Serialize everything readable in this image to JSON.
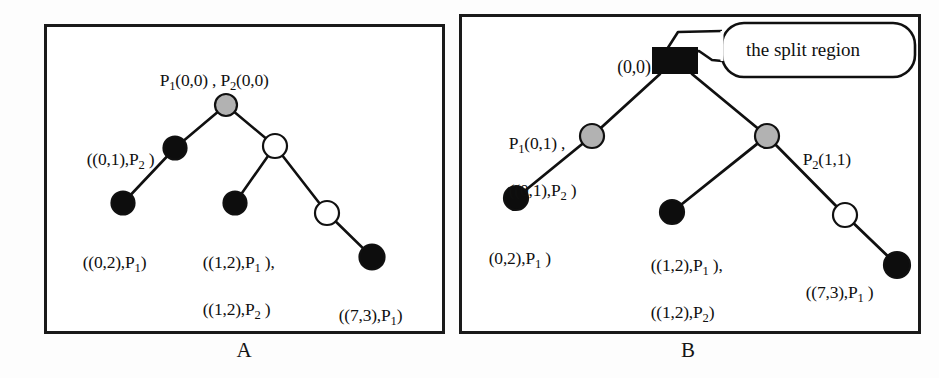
{
  "figure": {
    "panels": [
      {
        "id": "A",
        "caption": "A",
        "labels": {
          "root": "P1(0,0) , P2(0,0)",
          "left_child": "((0,1),P2 )",
          "left_leaf": "((0,2),P1)",
          "mid_leaf_line1": "((1,2),P1 ),",
          "mid_leaf_line2": "((1,2),P2 )",
          "right_leaf": "((7,3),P1)"
        },
        "nodes": [
          {
            "name": "root",
            "fill": "gray",
            "shape": "circle",
            "x": 226,
            "y": 105,
            "r": 11
          },
          {
            "name": "left-child",
            "fill": "black",
            "shape": "circle",
            "x": 175,
            "y": 148,
            "r": 11
          },
          {
            "name": "right-child",
            "fill": "white",
            "shape": "circle",
            "x": 275,
            "y": 146,
            "r": 12
          },
          {
            "name": "left-leaf",
            "fill": "black",
            "shape": "circle",
            "x": 123,
            "y": 203,
            "r": 11
          },
          {
            "name": "mid-leaf",
            "fill": "black",
            "shape": "circle",
            "x": 235,
            "y": 203,
            "r": 11
          },
          {
            "name": "right-inner",
            "fill": "white",
            "shape": "circle",
            "x": 327,
            "y": 213,
            "r": 12
          },
          {
            "name": "right-leaf",
            "fill": "black",
            "shape": "circle",
            "x": 372,
            "y": 257,
            "r": 12
          }
        ],
        "edges": [
          [
            "root",
            "left-child"
          ],
          [
            "root",
            "right-child"
          ],
          [
            "left-child",
            "left-leaf"
          ],
          [
            "right-child",
            "mid-leaf"
          ],
          [
            "right-child",
            "right-inner"
          ],
          [
            "right-inner",
            "right-leaf"
          ]
        ]
      },
      {
        "id": "B",
        "caption": "B",
        "labels": {
          "root": "(0,0)",
          "left_child_line1": "P1(0,1) ,",
          "left_child_line2": "((0,1),P2 )",
          "right_child": "P2(1,1)",
          "left_leaf": "(0,2),P1 )",
          "mid_leaf_line1": "((1,2),P1 ),",
          "mid_leaf_line2": "((1,2),P2)",
          "right_leaf": "((7,3),P1 )",
          "callout": "the split region"
        },
        "nodes": [
          {
            "name": "root",
            "fill": "black",
            "shape": "rect",
            "x": 675,
            "y": 60,
            "w": 46,
            "h": 26
          },
          {
            "name": "left-child",
            "fill": "gray",
            "shape": "circle",
            "x": 592,
            "y": 136,
            "r": 12
          },
          {
            "name": "right-child",
            "fill": "gray",
            "shape": "circle",
            "x": 767,
            "y": 136,
            "r": 12
          },
          {
            "name": "left-leaf",
            "fill": "black",
            "shape": "circle",
            "x": 516,
            "y": 198,
            "r": 12
          },
          {
            "name": "mid-leaf",
            "fill": "black",
            "shape": "circle",
            "x": 672,
            "y": 212,
            "r": 12
          },
          {
            "name": "right-inner",
            "fill": "white",
            "shape": "circle",
            "x": 845,
            "y": 215,
            "r": 12
          },
          {
            "name": "right-leaf",
            "fill": "black",
            "shape": "circle",
            "x": 897,
            "y": 265,
            "r": 13
          }
        ],
        "edges": [
          [
            "root",
            "left-child"
          ],
          [
            "root",
            "right-child"
          ],
          [
            "left-child",
            "left-leaf"
          ],
          [
            "right-child",
            "mid-leaf"
          ],
          [
            "right-child",
            "right-inner"
          ],
          [
            "right-inner",
            "right-leaf"
          ]
        ]
      }
    ]
  },
  "colors": {
    "stroke": "#101010",
    "node_gray": "#b2b2b2",
    "node_black": "#0d0d0d",
    "node_white": "#ffffff",
    "background": "#ffffff"
  }
}
